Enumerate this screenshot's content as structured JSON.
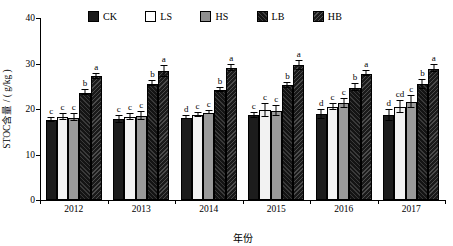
{
  "chart_data": {
    "type": "bar",
    "title": "",
    "xlabel": "年份",
    "ylabel": "STOC含量 / ( g/kg )",
    "ylim": [
      0,
      40
    ],
    "yticks": [
      0,
      10,
      20,
      30,
      40
    ],
    "grid": false,
    "legend_position": "top",
    "categories": [
      "2012",
      "2013",
      "2014",
      "2015",
      "2016",
      "2017"
    ],
    "series": [
      {
        "name": "CK",
        "values": [
          17.6,
          17.7,
          18.1,
          18.6,
          18.8,
          18.6
        ],
        "errors": [
          0.5,
          0.8,
          0.4,
          0.5,
          1.0,
          1.2
        ],
        "letters": [
          "c",
          "c",
          "d",
          "c",
          "d",
          "d"
        ]
      },
      {
        "name": "LS",
        "values": [
          18.2,
          18.2,
          18.7,
          19.7,
          20.4,
          20.4
        ],
        "errors": [
          0.6,
          0.7,
          0.4,
          1.5,
          0.7,
          1.3
        ],
        "letters": [
          "c",
          "c",
          "c",
          "c",
          "c",
          "cd"
        ]
      },
      {
        "name": "HS",
        "values": [
          18.1,
          18.4,
          19.2,
          19.6,
          21.3,
          21.6
        ],
        "errors": [
          0.7,
          0.9,
          0.4,
          1.1,
          1.0,
          1.3
        ],
        "letters": [
          "c",
          "c",
          "c",
          "c",
          "c",
          "c"
        ]
      },
      {
        "name": "LB",
        "values": [
          23.6,
          25.6,
          24.2,
          25.2,
          24.7,
          25.4
        ],
        "errors": [
          0.5,
          0.5,
          0.5,
          0.6,
          0.8,
          0.9
        ],
        "letters": [
          "b",
          "b",
          "b",
          "b",
          "b",
          "b"
        ]
      },
      {
        "name": "HB",
        "values": [
          27.2,
          28.3,
          29.0,
          29.6,
          27.8,
          28.9
        ],
        "errors": [
          0.6,
          1.2,
          0.6,
          1.0,
          0.6,
          0.8
        ],
        "letters": [
          "a",
          "a",
          "a",
          "a",
          "a",
          "a"
        ]
      }
    ]
  },
  "legend": {
    "items": [
      {
        "label": "CK",
        "swatch": "ck"
      },
      {
        "label": "LS",
        "swatch": "ls"
      },
      {
        "label": "HS",
        "swatch": "hs"
      },
      {
        "label": "LB",
        "swatch": "lb"
      },
      {
        "label": "HB",
        "swatch": "hb"
      }
    ]
  },
  "axes": {
    "y_title": "STOC含量 / ( g/kg )",
    "x_title": "年份",
    "y_tick_labels": [
      "40",
      "30",
      "20",
      "10",
      "0"
    ],
    "x_tick_labels": [
      "2012",
      "2013",
      "2014",
      "2015",
      "2016",
      "2017"
    ]
  }
}
